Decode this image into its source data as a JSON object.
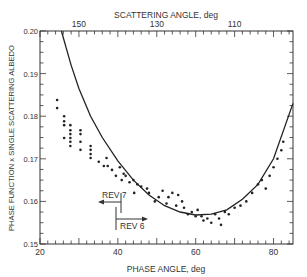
{
  "chart_data": {
    "type": "scatter",
    "title": "",
    "xlabel": "PHASE ANGLE, deg",
    "ylabel": "PHASE FUNCTION x SINGLE SCATTERING ALBEDO",
    "top_xlabel": "SCATTERING ANGLE, deg",
    "xlim": [
      20,
      85
    ],
    "ylim": [
      0.15,
      0.2
    ],
    "x_ticks": [
      20,
      40,
      60,
      80
    ],
    "y_ticks": [
      0.15,
      0.16,
      0.17,
      0.18,
      0.19,
      0.2
    ],
    "y_tick_labels": [
      "0.15",
      "0.16",
      "0.17",
      "0.18",
      "0.19",
      "0.20"
    ],
    "top_ticks": [
      150,
      130,
      110
    ],
    "grid": false,
    "legend": null,
    "annotations": [
      {
        "text": "REV 7",
        "x": 40.5,
        "y": 0.1645,
        "arrow": "left"
      },
      {
        "text": "REV 6",
        "x": 39.5,
        "y": 0.1575,
        "arrow": "right"
      }
    ],
    "series": [
      {
        "name": "observations",
        "kind": "points",
        "x": [
          24.4,
          24.4,
          26.2,
          26.2,
          26.2,
          27.8,
          27.8,
          27.8,
          27.8,
          26.2,
          27.8,
          27.8,
          30.4,
          30.4,
          30.4,
          30.4,
          33.0,
          33.0,
          33.0,
          33.0,
          35.1,
          37.1,
          36.4,
          37.4,
          38.5,
          39.5,
          40.5,
          41.5,
          41.0,
          42.0,
          43.0,
          44.0,
          45.0,
          44.2,
          46.0,
          47.5,
          48.0,
          49.5,
          50.5,
          51.5,
          52.5,
          53.0,
          54.0,
          55.0,
          55.5,
          56.5,
          57.0,
          58.0,
          59.0,
          60.0,
          60.5,
          61.5,
          62.0,
          63.0,
          64.0,
          65.0,
          66.0,
          66.5,
          67.5,
          68.5,
          70.0,
          71.5,
          73.0,
          74.5,
          76.0,
          77.0,
          78.0,
          79.0,
          80.0,
          81.0,
          82.0,
          82.5
        ],
        "y": [
          0.1838,
          0.1819,
          0.18,
          0.1788,
          0.1779,
          0.1779,
          0.1767,
          0.1758,
          0.1749,
          0.1749,
          0.174,
          0.173,
          0.1767,
          0.1758,
          0.174,
          0.1721,
          0.173,
          0.1721,
          0.1711,
          0.1702,
          0.1693,
          0.1702,
          0.1683,
          0.1683,
          0.1674,
          0.166,
          0.168,
          0.1665,
          0.165,
          0.166,
          0.1645,
          0.165,
          0.164,
          0.162,
          0.1635,
          0.163,
          0.162,
          0.16,
          0.161,
          0.1625,
          0.1595,
          0.161,
          0.162,
          0.159,
          0.1615,
          0.16,
          0.1585,
          0.157,
          0.1575,
          0.1565,
          0.158,
          0.1565,
          0.1555,
          0.156,
          0.155,
          0.157,
          0.156,
          0.1545,
          0.1575,
          0.157,
          0.1585,
          0.159,
          0.16,
          0.162,
          0.164,
          0.165,
          0.163,
          0.166,
          0.168,
          0.17,
          0.172,
          0.174
        ]
      },
      {
        "name": "model fit",
        "kind": "curve",
        "x": [
          25.5,
          28,
          30,
          33,
          36,
          40,
          44,
          48,
          52,
          56,
          60,
          64,
          68,
          72,
          76,
          80,
          85
        ],
        "y": [
          0.2,
          0.192,
          0.1865,
          0.18,
          0.175,
          0.1695,
          0.165,
          0.1615,
          0.159,
          0.1575,
          0.1568,
          0.157,
          0.158,
          0.1605,
          0.164,
          0.17,
          0.183
        ]
      }
    ]
  }
}
